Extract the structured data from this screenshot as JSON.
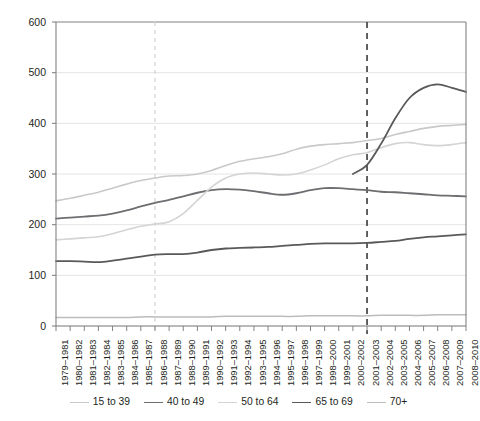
{
  "chart_data": {
    "type": "line",
    "title": "",
    "subtitle": "",
    "xlabel": "",
    "ylabel": "",
    "ylim": [
      0,
      600
    ],
    "yticks": [
      0,
      100,
      200,
      300,
      400,
      500,
      600
    ],
    "grid": true,
    "legend_position": "bottom",
    "categories": [
      "1979–1981",
      "1980–1982",
      "1981–1983",
      "1982–1984",
      "1983–1985",
      "1984–1986",
      "1985–1987",
      "1986–1988",
      "1987–1989",
      "1988–1990",
      "1989–1991",
      "1990–1992",
      "1991–1993",
      "1992–1994",
      "1993–1995",
      "1994–1996",
      "1995–1997",
      "1996–1998",
      "1997–1999",
      "1998–2000",
      "1999–2001",
      "2000–2002",
      "2001–2003",
      "2002–2004",
      "2003–2005",
      "2004–2006",
      "2005–2007",
      "2006–2008",
      "2007–2009",
      "2008–2010"
    ],
    "series": [
      {
        "name": "15 to 39",
        "color": "#c9c9c9",
        "width": 1.6,
        "values": [
          247,
          252,
          258,
          264,
          272,
          280,
          287,
          292,
          296,
          297,
          300,
          307,
          317,
          325,
          330,
          334,
          340,
          349,
          355,
          358,
          360,
          362,
          366,
          370,
          378,
          384,
          390,
          394,
          396,
          398
        ]
      },
      {
        "name": "40 to 49",
        "color": "#6d6e71",
        "width": 1.8,
        "values": [
          212,
          214,
          216,
          218,
          222,
          228,
          236,
          243,
          249,
          256,
          263,
          268,
          270,
          269,
          266,
          262,
          259,
          262,
          268,
          272,
          272,
          270,
          268,
          265,
          264,
          262,
          260,
          258,
          257,
          256
        ]
      },
      {
        "name": "50 to 64",
        "color": "#d4d4d4",
        "width": 1.6,
        "values": [
          170,
          172,
          174,
          176,
          182,
          190,
          197,
          201,
          206,
          222,
          248,
          274,
          292,
          300,
          302,
          300,
          298,
          300,
          308,
          318,
          330,
          338,
          342,
          352,
          360,
          362,
          358,
          356,
          358,
          362
        ]
      },
      {
        "name": "65 to 69",
        "color": "#58595b",
        "width": 1.8,
        "values": [
          128,
          128,
          127,
          126,
          129,
          133,
          137,
          141,
          142,
          142,
          145,
          150,
          153,
          154,
          155,
          156,
          158,
          160,
          162,
          163,
          163,
          163,
          164,
          166,
          168,
          172,
          175,
          177,
          179,
          181
        ]
      },
      {
        "name": "70+",
        "color": "#bcbcbc",
        "width": 1.5,
        "values": [
          17,
          17,
          17,
          17,
          17,
          17,
          18,
          18,
          18,
          18,
          18,
          18,
          19,
          19,
          19,
          19,
          19,
          19,
          20,
          20,
          20,
          20,
          20,
          21,
          21,
          21,
          21,
          22,
          22,
          22
        ]
      },
      {
        "name": "65 to 69 (upper)",
        "color": "#58595b",
        "width": 1.8,
        "hidden_from_legend": true,
        "values": [
          null,
          null,
          null,
          null,
          null,
          null,
          null,
          null,
          null,
          null,
          null,
          null,
          null,
          null,
          null,
          null,
          null,
          null,
          null,
          null,
          null,
          300,
          318,
          360,
          410,
          450,
          470,
          477,
          470,
          462
        ]
      }
    ],
    "reference_lines": [
      {
        "name": "light-dashed-marker",
        "category": "1986–1988",
        "color": "#d9d9d9",
        "dash": "4,4",
        "width": 1.4
      },
      {
        "name": "dark-dashed-marker",
        "category": "2001–2003",
        "color": "#3b3b3b",
        "dash": "6,5",
        "width": 1.6
      }
    ]
  },
  "axes": {
    "y_tick_labels": [
      "600",
      "500",
      "400",
      "300",
      "200",
      "100",
      "0"
    ]
  },
  "legend": {
    "items": [
      {
        "label": "15 to 39",
        "color": "#c9c9c9",
        "width": "1.6px"
      },
      {
        "label": "40 to 49",
        "color": "#6d6e71",
        "width": "1.8px"
      },
      {
        "label": "50 to 64",
        "color": "#d4d4d4",
        "width": "1.6px"
      },
      {
        "label": "65 to 69",
        "color": "#58595b",
        "width": "1.8px"
      },
      {
        "label": "70+",
        "color": "#bcbcbc",
        "width": "1.5px"
      }
    ]
  }
}
